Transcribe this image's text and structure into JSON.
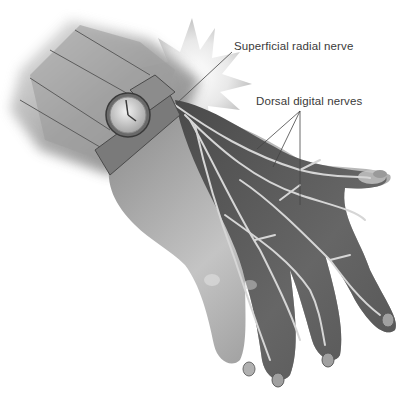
{
  "figure": {
    "labels": {
      "superficial_radial_nerve": "Superficial radial nerve",
      "dorsal_digital_nerves": "Dorsal digital nerves"
    },
    "colors": {
      "background": "#ffffff",
      "skin_light": "#b8b8b8",
      "skin_dark": "#5a5a5a",
      "nerve": "#d6d6d6",
      "leader_line": "#444444",
      "label_text": "#3a3a3a"
    }
  }
}
